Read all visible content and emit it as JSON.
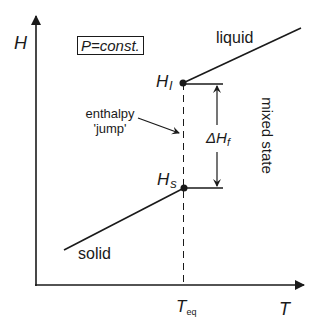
{
  "diagram": {
    "y_axis_label": "H",
    "x_axis_label": "T",
    "condition_box": "P=const.",
    "phases": {
      "liquid": "liquid",
      "solid": "solid",
      "mixed": "mixed  state"
    },
    "points": {
      "liquid_point": {
        "symbol": "H",
        "subscript": "l"
      },
      "solid_point": {
        "symbol": "H",
        "subscript": "s"
      }
    },
    "jump_annotation": {
      "line1": "enthalpy",
      "line2": "'jump'"
    },
    "delta_label": {
      "symbol": "ΔH",
      "subscript": "f"
    },
    "x_tick": {
      "symbol": "T",
      "subscript": "eq"
    },
    "colors": {
      "stroke": "#1a1a1a",
      "background": "#ffffff"
    }
  }
}
